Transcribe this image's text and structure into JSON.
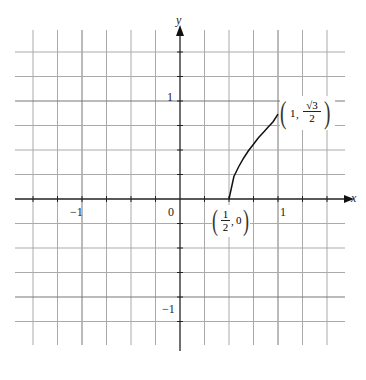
{
  "chart_data": {
    "type": "line",
    "title": "",
    "xlabel": "x",
    "ylabel": "y",
    "xlim": [
      -1.5,
      1.5
    ],
    "ylim": [
      -1.5,
      1.5
    ],
    "grid": true,
    "grid_step": 0.25,
    "x_tick_labels": [
      "-1",
      "0",
      "1"
    ],
    "y_tick_labels": [
      "1",
      "-1"
    ],
    "series": [
      {
        "name": "curve",
        "x": [
          0.5,
          0.55,
          0.6,
          0.65,
          0.7,
          0.75,
          0.8,
          0.85,
          0.9,
          0.95,
          1.0
        ],
        "y": [
          0,
          0.2291,
          0.3317,
          0.4183,
          0.495,
          0.559,
          0.6245,
          0.6801,
          0.7353,
          0.789,
          0.866
        ]
      }
    ],
    "annotations": [
      {
        "text": "(1/2, 0)",
        "x": 0.5,
        "y": 0
      },
      {
        "text": "(1, √3/2)",
        "x": 1,
        "y": 0.866
      }
    ]
  },
  "labels": {
    "x_axis": "x",
    "y_axis": "y",
    "tick_neg1_x": "−1",
    "tick_zero": "0",
    "tick_pos1_x": "1",
    "tick_pos1_y": "1",
    "tick_neg1_y": "−1",
    "start_point": {
      "num": "1",
      "den": "2",
      "second": "0"
    },
    "end_point": {
      "first": "1",
      "num": "√3",
      "den": "2"
    }
  }
}
